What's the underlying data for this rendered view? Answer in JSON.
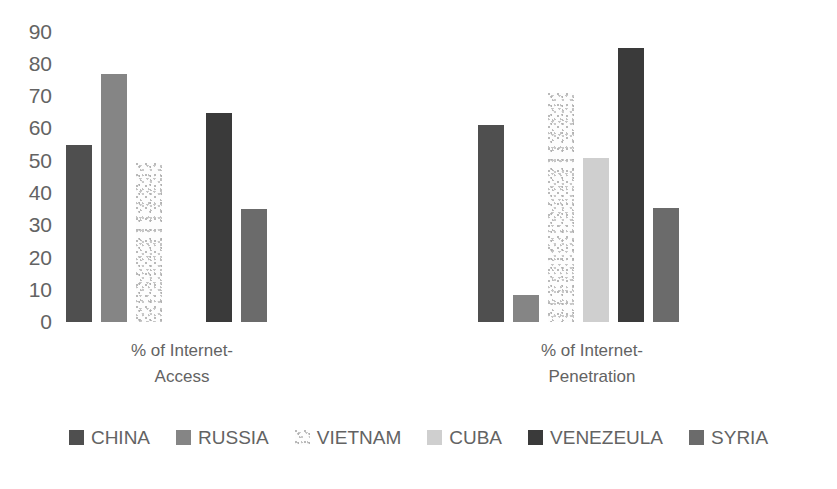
{
  "chart_data": {
    "type": "bar",
    "title": "",
    "xlabel": "",
    "ylabel": "",
    "ylim": [
      0,
      90
    ],
    "ytick_step": 10,
    "yticks": [
      90,
      80,
      70,
      60,
      50,
      40,
      30,
      20,
      10,
      0
    ],
    "grid": false,
    "legend_position": "bottom",
    "categories": [
      "% of Internet-Access",
      "% of Internet-Penetration"
    ],
    "series": [
      {
        "name": "CHINA",
        "color": "#4f4f4f",
        "values": [
          55,
          61
        ]
      },
      {
        "name": "RUSSIA",
        "color": "#858585",
        "values": [
          77,
          8.5
        ]
      },
      {
        "name": "VIETNAM",
        "color": "#fdfdfd",
        "values": [
          49.5,
          71
        ]
      },
      {
        "name": "CUBA",
        "color": "#cfcfcf",
        "values": [
          0,
          51
        ]
      },
      {
        "name": "VENEZEULA",
        "color": "#3a3a3a",
        "values": [
          65,
          85
        ]
      },
      {
        "name": "SYRIA",
        "color": "#6b6b6b",
        "values": [
          35,
          35.5
        ]
      }
    ]
  },
  "axis": {
    "ticks": [
      "90",
      "80",
      "70",
      "60",
      "50",
      "40",
      "30",
      "20",
      "10",
      "0"
    ]
  },
  "groups": [
    {
      "line1": "% of Internet-",
      "line2": "Access"
    },
    {
      "line1": "% of Internet-",
      "line2": "Penetration"
    }
  ],
  "legend": {
    "items": [
      {
        "label": "CHINA",
        "swatch": "china-swatch"
      },
      {
        "label": "RUSSIA",
        "swatch": "russia-swatch"
      },
      {
        "label": "VIETNAM",
        "swatch": "vietnam-swatch"
      },
      {
        "label": "CUBA",
        "swatch": "cuba-swatch"
      },
      {
        "label": "VENEZEULA",
        "swatch": "venezuela-swatch"
      },
      {
        "label": "SYRIA",
        "swatch": "syria-swatch"
      }
    ]
  }
}
